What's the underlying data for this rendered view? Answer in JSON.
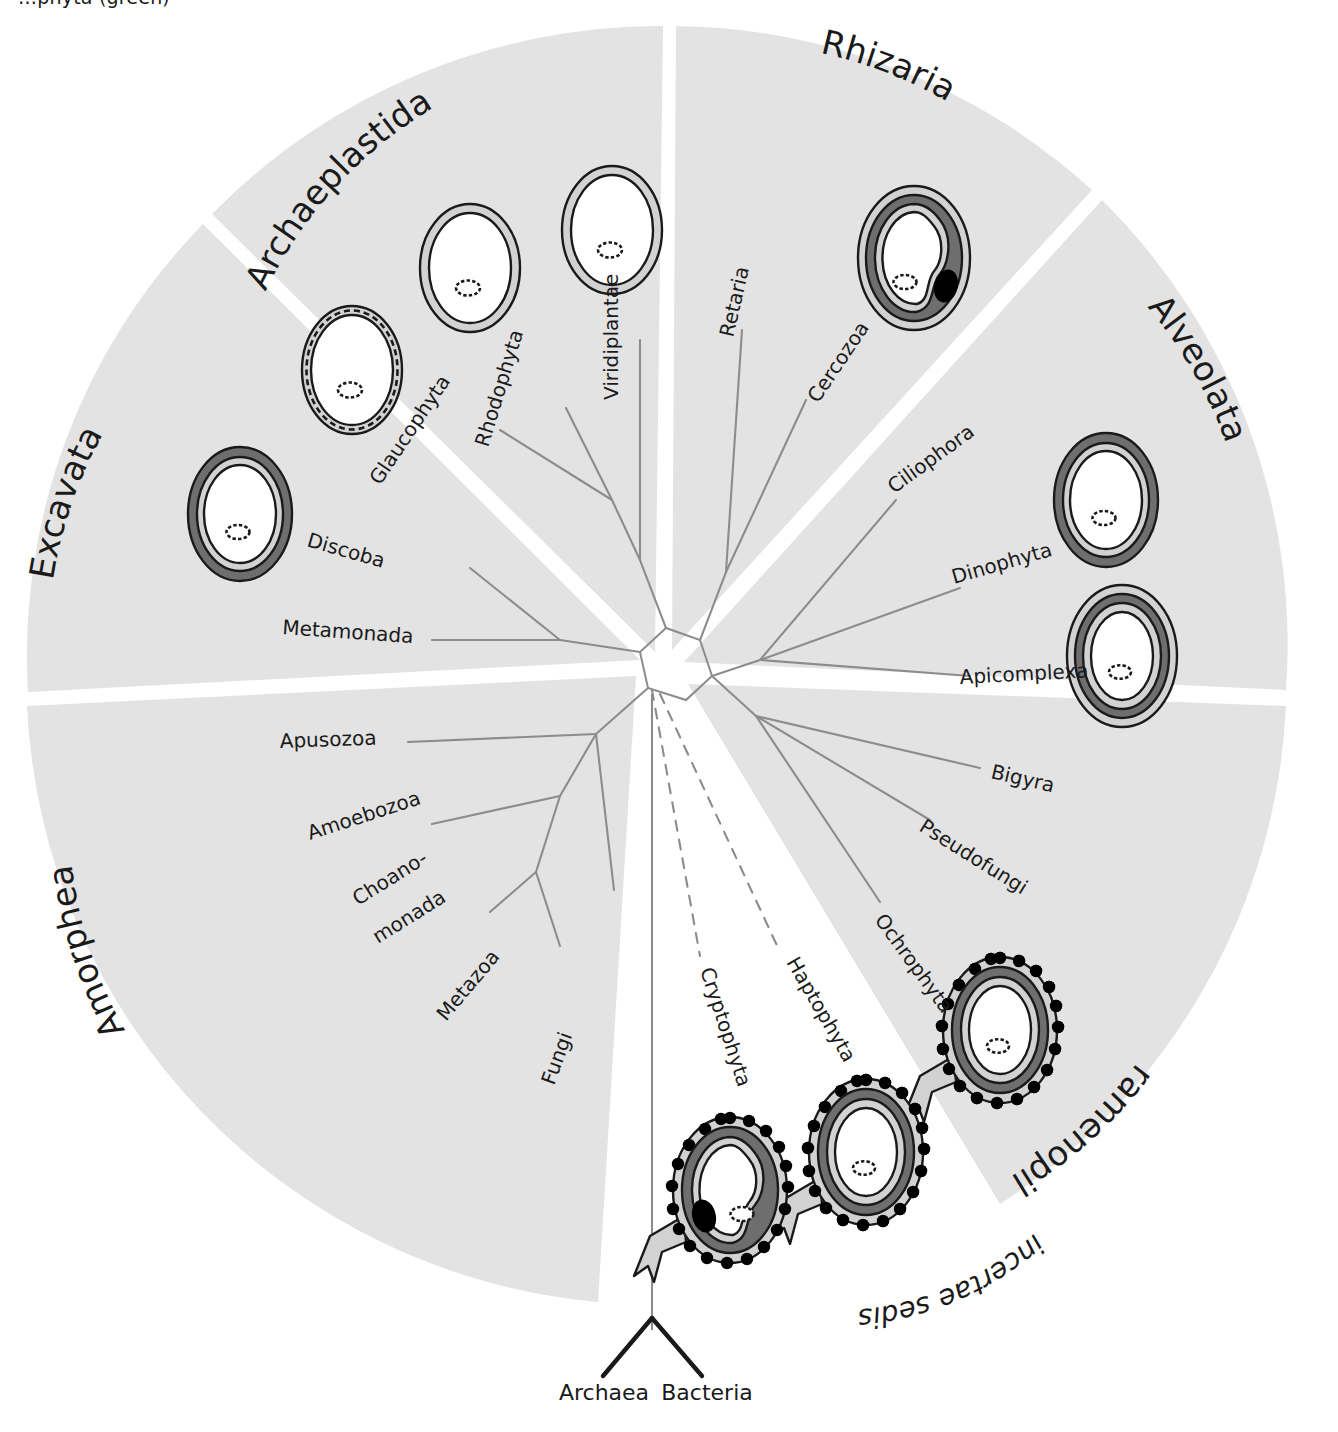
{
  "figure": {
    "type": "radial-phylogenetic-tree",
    "title_fragment_cropped": "…phyta (green)",
    "root_labels": [
      "Archaea",
      "Bacteria"
    ],
    "incertae_sedis_label": "incertae sedis"
  },
  "colors": {
    "sector_fill": "#e3e3e3",
    "branch_line": "#8c8c8c",
    "root_line": "#1a1a1a",
    "text": "#1a1a1a",
    "membrane_dark": "#6e6e6e",
    "membrane_mid": "#a8a8a8",
    "membrane_light": "#d2d2d2",
    "cell_interior": "#ffffff",
    "nucleomorph": "#000000",
    "outline": "#1a1a1a",
    "background": "#ffffff"
  },
  "supergroups": [
    {
      "name": "Archaeplastida",
      "label": "Archaeplastida",
      "taxa": [
        "Glaucophyta",
        "Rhodophyta",
        "Viridiplantae"
      ]
    },
    {
      "name": "Rhizaria",
      "label": "Rhizaria",
      "taxa": [
        "Retaria",
        "Cercozoa"
      ]
    },
    {
      "name": "Alveolata",
      "label": "Alveolata",
      "taxa": [
        "Ciliophora",
        "Dinophyta",
        "Apicomplexa"
      ]
    },
    {
      "name": "Stramenopiles",
      "label": "Stramenopiles",
      "taxa": [
        "Bigyra",
        "Pseudofungi",
        "Ochrophyta"
      ]
    },
    {
      "name": "Amorphea",
      "label": "Amorphea",
      "taxa": [
        "Apusozoa",
        "Amoebozoa",
        "Choano-monada",
        "Metazoa",
        "Fungi"
      ]
    },
    {
      "name": "Excavata",
      "label": "Excavata",
      "taxa": [
        "Discoba",
        "Metamonada"
      ]
    },
    {
      "name": "incertae sedis",
      "label": "incertae sedis",
      "taxa": [
        "Cryptophyta",
        "Haptophyta"
      ]
    }
  ],
  "taxa": {
    "glaucophyta": "Glaucophyta",
    "rhodophyta": "Rhodophyta",
    "viridiplantae": "Viridiplantae",
    "retaria": "Retaria",
    "cercozoa": "Cercozoa",
    "ciliophora": "Ciliophora",
    "dinophyta": "Dinophyta",
    "apicomplexa": "Apicomplexa",
    "bigyra": "Bigyra",
    "pseudofungi": "Pseudofungi",
    "ochrophyta": "Ochrophyta",
    "apusozoa": "Apusozoa",
    "amoebozoa": "Amoebozoa",
    "choanomonada_line1": "Choano-",
    "choanomonada_line2": "monada",
    "metazoa": "Metazoa",
    "fungi": "Fungi",
    "discoba": "Discoba",
    "metamonada": "Metamonada",
    "cryptophyta": "Cryptophyta",
    "haptophyta": "Haptophyta",
    "archaea": "Archaea",
    "bacteria": "Bacteria"
  },
  "cells": [
    {
      "id": "glaucophyta-cell",
      "taxon": "Glaucophyta",
      "membranes": 2,
      "dashed_wall": true,
      "nucleomorph": false,
      "ribosomes": false,
      "er_extension": false,
      "starch_grain": true
    },
    {
      "id": "rhodophyta-cell",
      "taxon": "Rhodophyta",
      "membranes": 2,
      "dashed_wall": false,
      "nucleomorph": false,
      "ribosomes": false,
      "er_extension": false,
      "starch_grain": true
    },
    {
      "id": "viridiplantae-cell",
      "taxon": "Viridiplantae",
      "membranes": 2,
      "dashed_wall": false,
      "nucleomorph": false,
      "ribosomes": false,
      "er_extension": false,
      "starch_grain": true
    },
    {
      "id": "cercozoa-cell",
      "taxon": "Cercozoa",
      "membranes": 4,
      "dashed_wall": false,
      "nucleomorph": true,
      "ribosomes": false,
      "er_extension": false,
      "starch_grain": true
    },
    {
      "id": "dinophyta-cell",
      "taxon": "Dinophyta",
      "membranes": 3,
      "dashed_wall": false,
      "nucleomorph": false,
      "ribosomes": false,
      "er_extension": false,
      "starch_grain": true
    },
    {
      "id": "apicomplexa-cell",
      "taxon": "Apicomplexa",
      "membranes": 4,
      "dashed_wall": false,
      "nucleomorph": false,
      "ribosomes": false,
      "er_extension": false,
      "starch_grain": true
    },
    {
      "id": "discoba-cell",
      "taxon": "Discoba",
      "membranes": 3,
      "dashed_wall": false,
      "nucleomorph": false,
      "ribosomes": false,
      "er_extension": false,
      "starch_grain": true
    },
    {
      "id": "ochrophyta-cell",
      "taxon": "Ochrophyta",
      "membranes": 4,
      "dashed_wall": false,
      "nucleomorph": false,
      "ribosomes": true,
      "er_extension": true,
      "starch_grain": true
    },
    {
      "id": "haptophyta-cell",
      "taxon": "Haptophyta",
      "membranes": 4,
      "dashed_wall": false,
      "nucleomorph": false,
      "ribosomes": true,
      "er_extension": true,
      "starch_grain": true
    },
    {
      "id": "cryptophyta-cell",
      "taxon": "Cryptophyta",
      "membranes": 4,
      "dashed_wall": false,
      "nucleomorph": true,
      "ribosomes": true,
      "er_extension": true,
      "starch_grain": true
    }
  ]
}
